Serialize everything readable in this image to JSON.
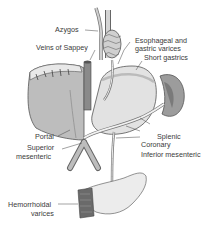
{
  "diagram": {
    "type": "anatomical illustration",
    "labels": {
      "azygos": "Azygos",
      "veins_of_sappey": "Veins of Sappey",
      "esophageal_1": "Esophageal and",
      "esophageal_2": "gastric varices",
      "short_gastrics": "Short gastrics",
      "portal": "Portal",
      "superior_1": "Superior",
      "superior_2": "mesenteric",
      "splenic": "Splenic",
      "coronary": "Coronary",
      "inferior_mesenteric": "Inferior mesenteric",
      "hemorrhoidal_1": "Hemorrhoidal",
      "hemorrhoidal_2": "varices"
    },
    "colors": {
      "organ_fill": "#c8c8c8",
      "organ_dark": "#8a8a8a",
      "vessel": "#d9d9d9",
      "outline": "#555555",
      "leader": "#444444",
      "text": "#3a3a3a"
    }
  }
}
